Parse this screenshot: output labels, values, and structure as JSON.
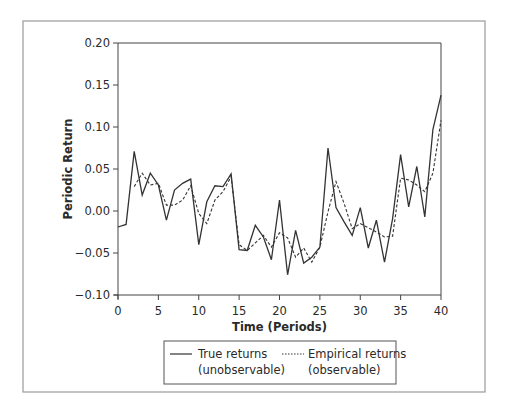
{
  "chart_data": {
    "type": "line",
    "title": "",
    "xlabel": "Time (Periods)",
    "ylabel": "Periodic Return",
    "xlim": [
      0,
      40
    ],
    "ylim": [
      -0.1,
      0.2
    ],
    "x_ticks": [
      0,
      5,
      10,
      15,
      20,
      25,
      30,
      35,
      40
    ],
    "y_ticks": [
      -0.1,
      -0.05,
      0.0,
      0.05,
      0.1,
      0.15,
      0.2
    ],
    "y_tick_labels": [
      "−0.10",
      "−0.05",
      "0.00",
      "0.05",
      "0.10",
      "0.15",
      "0.20"
    ],
    "grid": false,
    "legend_position": "bottom-center (below x-axis, boxed)",
    "x": [
      0,
      1,
      2,
      3,
      4,
      5,
      6,
      7,
      8,
      9,
      10,
      11,
      12,
      13,
      14,
      15,
      16,
      17,
      18,
      19,
      20,
      21,
      22,
      23,
      24,
      25,
      26,
      27,
      28,
      29,
      30,
      31,
      32,
      33,
      34,
      35,
      36,
      37,
      38,
      39,
      40
    ],
    "series": [
      {
        "name": "True returns (unobservable)",
        "legend_line1": "True returns",
        "legend_line2": "(unobservable)",
        "style": "solid",
        "color": "#333333",
        "x": [
          0,
          1,
          2,
          3,
          4,
          5,
          6,
          7,
          8,
          9,
          10,
          11,
          12,
          13,
          14,
          15,
          16,
          17,
          18,
          19,
          20,
          21,
          22,
          23,
          24,
          25,
          26,
          27,
          28,
          29,
          30,
          31,
          32,
          33,
          34,
          35,
          36,
          37,
          38,
          39,
          40
        ],
        "values": [
          -0.019,
          -0.016,
          0.071,
          0.019,
          0.045,
          0.031,
          -0.011,
          0.025,
          0.033,
          0.038,
          -0.04,
          0.011,
          0.03,
          0.029,
          0.044,
          -0.046,
          -0.047,
          -0.017,
          -0.031,
          -0.058,
          0.013,
          -0.076,
          -0.023,
          -0.062,
          -0.055,
          -0.043,
          0.075,
          0.004,
          -0.013,
          -0.029,
          0.004,
          -0.044,
          -0.011,
          -0.061,
          -0.009,
          0.067,
          0.005,
          0.053,
          -0.007,
          0.097,
          0.138
        ]
      },
      {
        "name": "Empirical returns (observable)",
        "legend_line1": "Empirical returns",
        "legend_line2": "(observable)",
        "style": "dashed",
        "color": "#333333",
        "x": [
          2,
          3,
          4,
          5,
          6,
          7,
          8,
          9,
          10,
          11,
          12,
          13,
          14,
          15,
          16,
          17,
          18,
          19,
          20,
          21,
          22,
          23,
          24,
          25,
          26,
          27,
          28,
          29,
          30,
          31,
          32,
          33,
          34,
          35,
          36,
          37,
          38,
          39,
          40
        ],
        "values": [
          0.029,
          0.045,
          0.031,
          0.033,
          0.007,
          0.007,
          0.013,
          0.03,
          -0.003,
          -0.015,
          0.013,
          0.023,
          0.041,
          -0.04,
          -0.047,
          -0.038,
          -0.029,
          -0.043,
          -0.026,
          -0.032,
          -0.055,
          -0.044,
          -0.061,
          -0.043,
          -0.001,
          0.035,
          0.009,
          -0.021,
          -0.015,
          -0.02,
          -0.025,
          -0.031,
          -0.03,
          0.039,
          0.037,
          0.031,
          0.023,
          0.045,
          0.108
        ]
      }
    ]
  },
  "labels": {
    "xlabel": "Time (Periods)",
    "ylabel": "Periodic Return",
    "legend_true_line1": "True returns",
    "legend_true_line2": "(unobservable)",
    "legend_emp_line1": "Empirical returns",
    "legend_emp_line2": "(observable)"
  },
  "layout": {
    "frame": {
      "x": 23,
      "y": 21,
      "w": 462,
      "h": 371
    },
    "plot": {
      "x0": 118,
      "x1": 441,
      "y_top": 43,
      "y_bottom": 295
    },
    "legend": {
      "x": 164,
      "y": 341,
      "w": 232,
      "h": 43
    },
    "frame_color": "#9a9a9a",
    "axis_color": "#444444",
    "line_color": "#333333"
  }
}
